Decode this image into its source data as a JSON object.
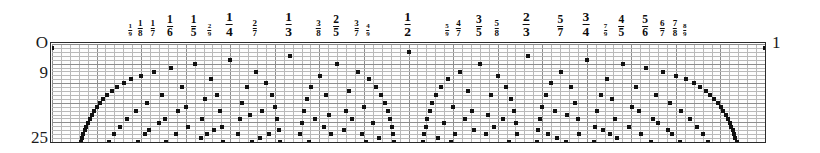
{
  "figure": {
    "title": "",
    "end_label": "1",
    "origin_label": "O"
  },
  "axes": {
    "y_labels": [
      {
        "text": "O",
        "value": 0
      },
      {
        "text": "9",
        "value": 9
      },
      {
        "text": "25",
        "value": 25
      }
    ],
    "y_axis_label": "",
    "x_axis_label": "",
    "x_min": 0,
    "x_max": 1,
    "y_min": 0,
    "y_max": 25
  },
  "chart_data": {
    "type": "scatter",
    "title": "",
    "xlabel": "",
    "ylabel": "",
    "xlim": [
      0,
      1
    ],
    "ylim": [
      0,
      25
    ],
    "y_inverted": true,
    "grid": true,
    "grid_minor_spacing_x": 0.0125,
    "grid_minor_spacing_y": 1,
    "max_denominator": 25,
    "point_marker": "square",
    "point_color": "#111111",
    "tick_labels": [
      {
        "num": "0",
        "den": "",
        "x": 0.0,
        "size": 0,
        "display": "O"
      },
      {
        "num": "1",
        "den": "9",
        "x": 0.1111111111111111,
        "size": 4
      },
      {
        "num": "1",
        "den": "8",
        "x": 0.125,
        "size": 3
      },
      {
        "num": "1",
        "den": "7",
        "x": 0.14285714285714285,
        "size": 3
      },
      {
        "num": "1",
        "den": "6",
        "x": 0.16666666666666666,
        "size": 2
      },
      {
        "num": "1",
        "den": "5",
        "x": 0.2,
        "size": 2
      },
      {
        "num": "2",
        "den": "9",
        "x": 0.2222222222222222,
        "size": 4
      },
      {
        "num": "1",
        "den": "4",
        "x": 0.25,
        "size": 1
      },
      {
        "num": "2",
        "den": "7",
        "x": 0.2857142857142857,
        "size": 3
      },
      {
        "num": "1",
        "den": "3",
        "x": 0.3333333333333333,
        "size": 1
      },
      {
        "num": "3",
        "den": "8",
        "x": 0.375,
        "size": 3
      },
      {
        "num": "2",
        "den": "5",
        "x": 0.4,
        "size": 2
      },
      {
        "num": "3",
        "den": "7",
        "x": 0.42857142857142855,
        "size": 3
      },
      {
        "num": "4",
        "den": "9",
        "x": 0.4444444444444444,
        "size": 4
      },
      {
        "num": "1",
        "den": "2",
        "x": 0.5,
        "size": 1
      },
      {
        "num": "5",
        "den": "9",
        "x": 0.5555555555555556,
        "size": 4
      },
      {
        "num": "4",
        "den": "7",
        "x": 0.5714285714285714,
        "size": 3
      },
      {
        "num": "3",
        "den": "5",
        "x": 0.6,
        "size": 2
      },
      {
        "num": "5",
        "den": "8",
        "x": 0.625,
        "size": 3
      },
      {
        "num": "2",
        "den": "3",
        "x": 0.6666666666666666,
        "size": 1
      },
      {
        "num": "5",
        "den": "7",
        "x": 0.7142857142857143,
        "size": 2
      },
      {
        "num": "3",
        "den": "4",
        "x": 0.75,
        "size": 1
      },
      {
        "num": "7",
        "den": "9",
        "x": 0.7777777777777778,
        "size": 4
      },
      {
        "num": "4",
        "den": "5",
        "x": 0.8,
        "size": 2
      },
      {
        "num": "5",
        "den": "6",
        "x": 0.8333333333333334,
        "size": 2
      },
      {
        "num": "6",
        "den": "7",
        "x": 0.8571428571428571,
        "size": 3
      },
      {
        "num": "7",
        "den": "8",
        "x": 0.875,
        "size": 3
      },
      {
        "num": "8",
        "den": "9",
        "x": 0.8888888888888888,
        "size": 4
      },
      {
        "num": "1",
        "den": "",
        "x": 1.0,
        "size": 0,
        "display": "1"
      }
    ]
  },
  "colors": {
    "ink": "#111111",
    "grid_minor": "#b9b9b9",
    "grid_major": "#8d8d8d",
    "plot_border": "#2b2b2b",
    "background": "#ffffff",
    "plot_background": "#fdfdfd"
  }
}
